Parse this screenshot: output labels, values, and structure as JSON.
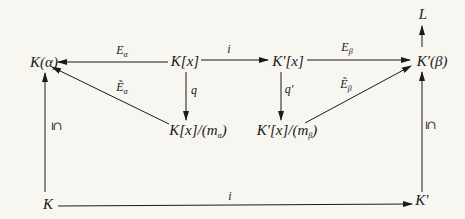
{
  "diagram": {
    "type": "commutative-diagram",
    "nodes": {
      "K_alpha": "K(α)",
      "Kx": "K[x]",
      "Kpx": "K′[x]",
      "Kp_beta": "K′(β)",
      "L": "L",
      "Kx_mod": "K[x]/(mα)",
      "Kpx_mod": "K′[x]/(mβ)",
      "K": "K",
      "Kp": "K′"
    },
    "arrows": [
      {
        "from": "Kx",
        "to": "K_alpha",
        "label": "Eα"
      },
      {
        "from": "Kx",
        "to": "Kpx",
        "label": "i"
      },
      {
        "from": "Kpx",
        "to": "Kp_beta",
        "label": "Eβ"
      },
      {
        "from": "Kx",
        "to": "Kx_mod",
        "label": "q"
      },
      {
        "from": "Kpx",
        "to": "Kpx_mod",
        "label": "q′"
      },
      {
        "from": "Kx_mod",
        "to": "K_alpha",
        "label": "Ẽα"
      },
      {
        "from": "Kpx_mod",
        "to": "Kp_beta",
        "label": "Ẽβ"
      },
      {
        "from": "Kp_beta",
        "to": "L",
        "label": ""
      },
      {
        "from": "K",
        "to": "K_alpha",
        "label": "⊆"
      },
      {
        "from": "Kp",
        "to": "Kp_beta",
        "label": "⊆"
      },
      {
        "from": "K",
        "to": "Kp",
        "label": "i"
      }
    ],
    "labels": {
      "E": "E",
      "alpha": "α",
      "beta": "β",
      "i_top": "i",
      "i_bottom": "i",
      "q": "q",
      "qp": "q′",
      "Etilde": "Ẽ",
      "subset_left": "⊆",
      "subset_right": "⊆",
      "K": "K",
      "Kp": "K′",
      "L": "L"
    }
  }
}
